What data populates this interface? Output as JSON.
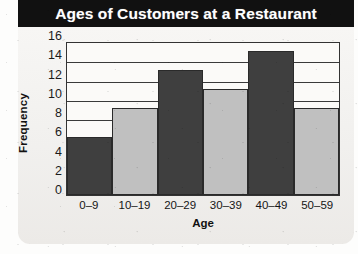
{
  "chart_data": {
    "type": "bar",
    "title": "Ages of Customers at a Restaurant",
    "xlabel": "Age",
    "ylabel": "Frequency",
    "categories": [
      "0–9",
      "10–19",
      "20–29",
      "30–39",
      "40–49",
      "50–59"
    ],
    "values": [
      6,
      9,
      13,
      11,
      15,
      9
    ],
    "ylim": [
      0,
      16
    ],
    "ytick_step": 2,
    "yticks": [
      16,
      14,
      12,
      10,
      8,
      6,
      4,
      2,
      0
    ],
    "grid": true,
    "grid_axis": "y",
    "legend": null,
    "legend_position": "none",
    "bar_colors": [
      "#3f3f3f",
      "#c0c0c0",
      "#3f3f3f",
      "#c0c0c0",
      "#3f3f3f",
      "#c0c0c0"
    ],
    "annotations": []
  },
  "style": {
    "title_text_color": "#ffffff",
    "title_band_color": "#111111",
    "frame_color": "#111111",
    "paper_color": "#f4f3f1",
    "plot_bg_color": "#fbfaf8",
    "axis_line_color": "#333333",
    "gridline_color": "#3a3a3a",
    "dark_bar_color": "#3f3f3f",
    "light_bar_color": "#c0c0c0",
    "tick_label_color": "#1b1b1b"
  }
}
